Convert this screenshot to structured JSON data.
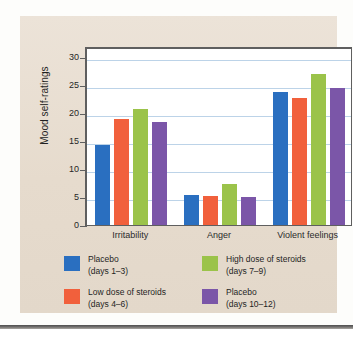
{
  "chart_data": {
    "type": "bar",
    "title": "",
    "xlabel": "",
    "ylabel": "Mood self-ratings",
    "ylim": [
      0,
      32
    ],
    "yticks": [
      0,
      5,
      10,
      15,
      20,
      25,
      30
    ],
    "ytick_labels": [
      "0",
      "5",
      "10",
      "15",
      "20",
      "25",
      "30"
    ],
    "grid": true,
    "legend_position": "below",
    "categories": [
      "Irritability",
      "Anger",
      "Violent feelings"
    ],
    "series": [
      {
        "name": "Placebo (days 1-3)",
        "legend_line1": "Placebo",
        "legend_line2": "(days 1–3)",
        "color": "#2a6fc0",
        "values": [
          14.4,
          5.3,
          23.8
        ]
      },
      {
        "name": "Low dose of steroids (days 4-6)",
        "legend_line1": "Low dose of steroids",
        "legend_line2": "(days 4–6)",
        "color": "#f1603c",
        "values": [
          18.9,
          5.2,
          22.7
        ]
      },
      {
        "name": "High dose of steroids (days 7-9)",
        "legend_line1": "High dose of steroids",
        "legend_line2": "(days 7–9)",
        "color": "#9bc34a",
        "values": [
          20.8,
          7.4,
          27.0
        ]
      },
      {
        "name": "Placebo (days 10-12)",
        "legend_line1": "Placebo",
        "legend_line2": "(days 10–12)",
        "color": "#7b56a8",
        "values": [
          18.5,
          5.1,
          24.5
        ]
      }
    ]
  },
  "colors": {
    "panel_background": "#e8ded2",
    "plot_background": "#ffffff",
    "gridline": "#bcd3e8",
    "axis": "#5f5f5f",
    "text": "#1f1f1f"
  }
}
